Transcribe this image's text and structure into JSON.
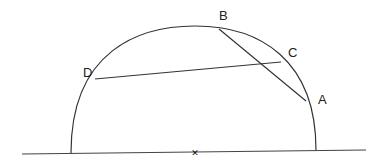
{
  "diagram": {
    "type": "geometry",
    "stroke_color": "#333333",
    "background": "#ffffff",
    "baseline": {
      "x1": 22,
      "y1": 154,
      "x2": 366,
      "y2": 150
    },
    "center_mark": {
      "x": 195,
      "y": 152,
      "symbol": "✕"
    },
    "semicircle": {
      "left_end": [
        71,
        153
      ],
      "right_end": [
        316,
        150
      ],
      "top": [
        195,
        26
      ]
    },
    "points": [
      {
        "label": "A",
        "x": 306,
        "y": 101,
        "label_x": 318,
        "label_y": 104
      },
      {
        "label": "B",
        "x": 219,
        "y": 29,
        "label_x": 219,
        "label_y": 20
      },
      {
        "label": "C",
        "x": 281,
        "y": 62,
        "label_x": 288,
        "label_y": 57
      },
      {
        "label": "D",
        "x": 95,
        "y": 79,
        "label_x": 83,
        "label_y": 77
      }
    ],
    "chords": [
      {
        "from": "D",
        "to": "C"
      },
      {
        "from": "B",
        "to": "A"
      }
    ]
  }
}
